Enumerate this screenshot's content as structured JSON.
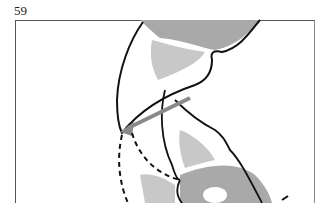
{
  "page": {
    "number": "59"
  },
  "figure": {
    "type": "anatomical line illustration",
    "colors": {
      "outline": "#111111",
      "shade_dark": "#a9a9a9",
      "shade_light": "#c8c8c8",
      "highlight": "#ffffff",
      "arrow": "#8a8a8a",
      "frame": "#555555"
    }
  }
}
